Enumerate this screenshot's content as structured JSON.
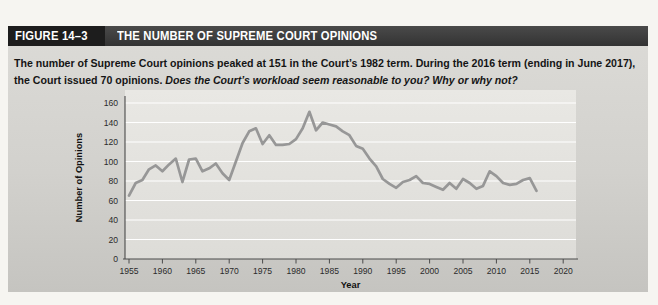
{
  "figure": {
    "label": "FIGURE 14–3",
    "title": "THE NUMBER OF SUPREME COURT OPINIONS",
    "caption_main": "The number of Supreme Court opinions peaked at 151 in the Court’s 1982 term. During the 2016 term (ending in June 2017), the Court issued 70 opinions. ",
    "caption_question": "Does the Court’s workload seem reasonable to you? Why or why not?"
  },
  "chart_data": {
    "type": "line",
    "title": "",
    "xlabel": "Year",
    "ylabel": "Number of Opinions",
    "x": [
      1955,
      1956,
      1957,
      1958,
      1959,
      1960,
      1961,
      1962,
      1963,
      1964,
      1965,
      1966,
      1967,
      1968,
      1969,
      1970,
      1971,
      1972,
      1973,
      1974,
      1975,
      1976,
      1977,
      1978,
      1979,
      1980,
      1981,
      1982,
      1983,
      1984,
      1985,
      1986,
      1987,
      1988,
      1989,
      1990,
      1991,
      1992,
      1993,
      1994,
      1995,
      1996,
      1997,
      1998,
      1999,
      2000,
      2001,
      2002,
      2003,
      2004,
      2005,
      2006,
      2007,
      2008,
      2009,
      2010,
      2011,
      2012,
      2013,
      2014,
      2015,
      2016
    ],
    "values": [
      65,
      78,
      81,
      92,
      96,
      90,
      97,
      103,
      79,
      102,
      103,
      90,
      93,
      98,
      88,
      81,
      100,
      119,
      131,
      134,
      118,
      127,
      117,
      117,
      118,
      123,
      134,
      151,
      132,
      140,
      138,
      136,
      131,
      127,
      116,
      113,
      103,
      95,
      82,
      77,
      73,
      79,
      81,
      85,
      78,
      77,
      74,
      71,
      78,
      72,
      82,
      78,
      72,
      75,
      90,
      85,
      78,
      76,
      77,
      81,
      83,
      70
    ],
    "ylim": [
      0,
      160
    ],
    "ytick_step": 20,
    "xticks": [
      1955,
      1960,
      1965,
      1970,
      1975,
      1980,
      1985,
      1990,
      1995,
      2000,
      2005,
      2010,
      2015,
      2020
    ],
    "grid": true,
    "legend": "none",
    "annotations": [
      "peak 151 at 1982 term",
      "70 opinions in 2016 term"
    ]
  },
  "colors": {
    "header_label_bg": "#1d1d1d",
    "header_title_bg": "#3b3b3b",
    "header_text": "#ffffff",
    "body_bg": "#d2d1cd",
    "plot_bg": "#e9e8e4",
    "gridline": "#ffffff",
    "axis": "#4a4a4a",
    "line": "#979797",
    "text": "#151515"
  }
}
